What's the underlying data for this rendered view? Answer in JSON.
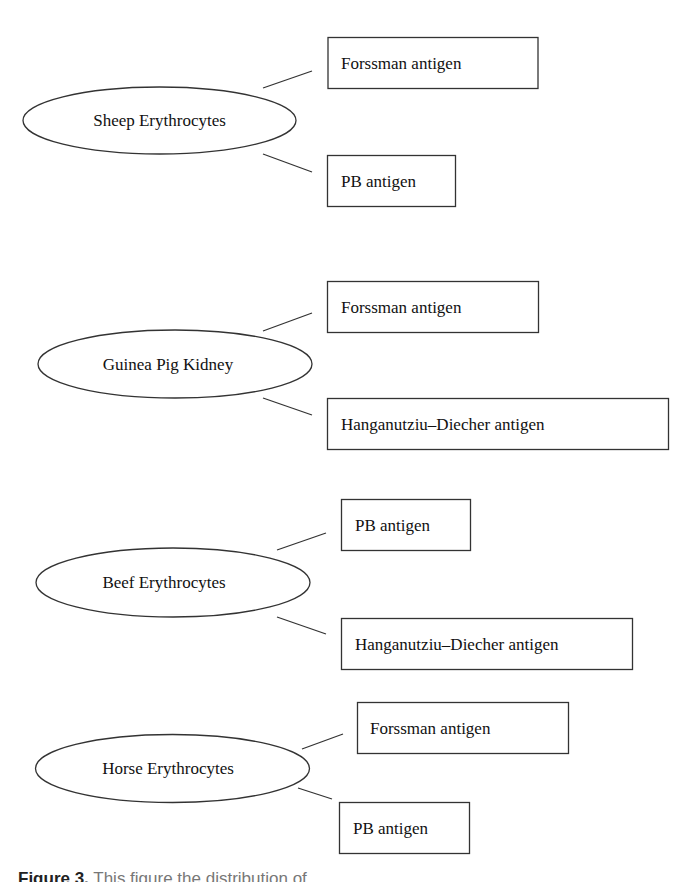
{
  "diagram": {
    "type": "concept-map",
    "stroke_color": "#333333",
    "groups": [
      {
        "source": "Sheep Erythrocytes",
        "antigens": [
          "Forssman antigen",
          "PB antigen"
        ]
      },
      {
        "source": "Guinea Pig Kidney",
        "antigens": [
          "Forssman antigen",
          "Hanganutziu–Diecher antigen"
        ]
      },
      {
        "source": "Beef Erythrocytes",
        "antigens": [
          "PB antigen",
          "Hanganutziu–Diecher antigen"
        ]
      },
      {
        "source": "Horse Erythrocytes",
        "antigens": [
          "Forssman antigen",
          "PB antigen"
        ]
      }
    ]
  },
  "caption": {
    "label": "Figure 3.",
    "text": "This figure the distribution of"
  }
}
